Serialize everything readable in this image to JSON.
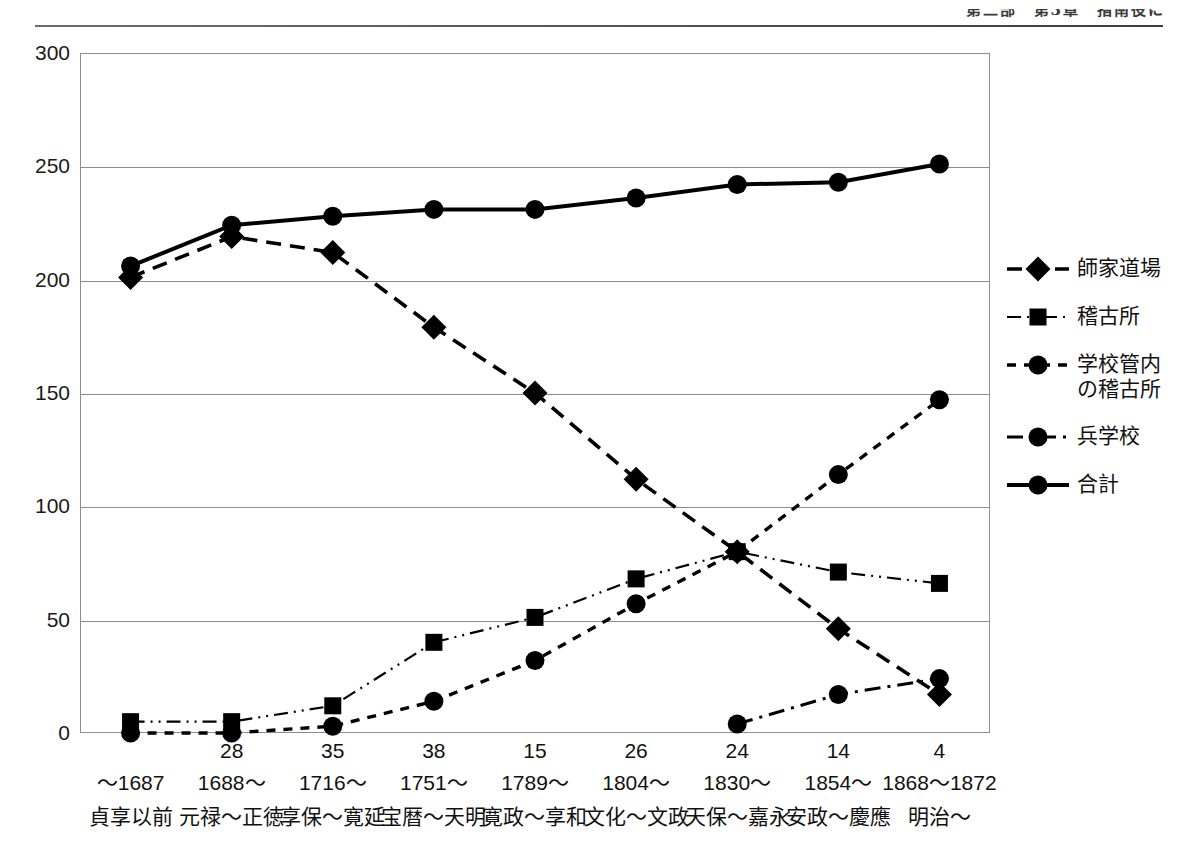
{
  "running_head": "第二部　第3章　指南役に",
  "chart_data": {
    "type": "line",
    "title": "",
    "xlabel": "",
    "ylabel": "",
    "ylim": [
      0,
      300
    ],
    "ytick_step": 50,
    "yticks": [
      "0",
      "50",
      "100",
      "150",
      "200",
      "250",
      "300"
    ],
    "grid": true,
    "legend_position": "right",
    "categories": [
      "～1687",
      "1688～",
      "1716～",
      "1751～",
      "1789～",
      "1804～",
      "1830～",
      "1854～",
      "1868～1872"
    ],
    "category_eras": [
      "貞享以前",
      "元禄～正徳",
      "享保～寛延",
      "宝暦～天明",
      "寛政～享和",
      "文化～文政",
      "天保～嘉永",
      "安政～慶應",
      "明治～"
    ],
    "category_counts": [
      "",
      "28",
      "35",
      "38",
      "15",
      "26",
      "24",
      "14",
      "4"
    ],
    "series": [
      {
        "name": "師家道場",
        "marker": "diamond",
        "dash": "dashed",
        "values": [
          201,
          219,
          212,
          179,
          150,
          112,
          80,
          46,
          17
        ]
      },
      {
        "name": "稽古所",
        "marker": "square",
        "dash": "dash-dot-dot",
        "values": [
          5,
          5,
          12,
          40,
          51,
          68,
          80,
          71,
          66
        ]
      },
      {
        "name": "学校管内\nの稽古所",
        "marker": "circle",
        "dash": "dotted",
        "values": [
          0,
          0,
          3,
          14,
          32,
          57,
          80,
          114,
          147
        ]
      },
      {
        "name": "兵学校",
        "marker": "circle",
        "dash": "dash-dot",
        "values": [
          null,
          null,
          null,
          null,
          null,
          null,
          4,
          17,
          24
        ]
      },
      {
        "name": "合計",
        "marker": "circle",
        "dash": "solid",
        "values": [
          206,
          224,
          228,
          231,
          231,
          236,
          242,
          243,
          251
        ]
      }
    ]
  },
  "colors": {
    "ink": "#000000",
    "grid": "#8d8d8d",
    "text": "#111111"
  }
}
